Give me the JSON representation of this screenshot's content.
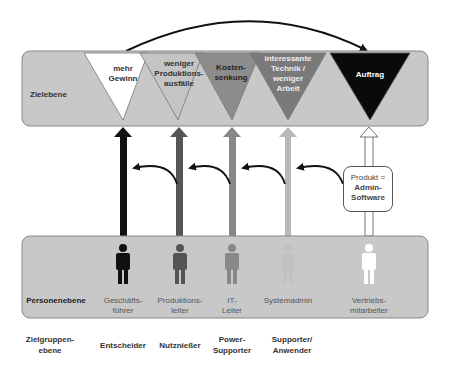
{
  "diagram": {
    "top_panel": {
      "label": "Zielebene"
    },
    "goals": [
      {
        "line1": "mehr",
        "line2": "Gewinn",
        "line3": "",
        "line4": "",
        "fill": "#ffffff",
        "text_color": "#333333"
      },
      {
        "line1": "weniger",
        "line2": "Produktions-",
        "line3": "ausfälle",
        "line4": "",
        "fill": "#c4c4c4",
        "text_color": "#333333"
      },
      {
        "line1": "Kosten-",
        "line2": "senkung",
        "line3": "",
        "line4": "",
        "fill": "#8c8c8c",
        "text_color": "#222222"
      },
      {
        "line1": "interessante",
        "line2": "Technik /",
        "line3": "weniger",
        "line4": "Arbeit",
        "fill": "#7a7a7a",
        "text_color": "#eeeeee"
      },
      {
        "line1": "Auftrag",
        "line2": "",
        "line3": "",
        "line4": "",
        "fill": "#0a0a0a",
        "text_color": "#ffffff"
      }
    ],
    "product_box": {
      "line1": "Produkt =",
      "line2": "Admin-",
      "line3": "Software"
    },
    "bottom_panel": {
      "label": "Personenebene"
    },
    "persons": [
      {
        "line1": "Geschäfts-",
        "line2": "führer",
        "color": "#111111"
      },
      {
        "line1": "Produktions-",
        "line2": "leiter",
        "color": "#555555"
      },
      {
        "line1": "IT-",
        "line2": "Leiter",
        "color": "#888888"
      },
      {
        "line1": "Systemadmin",
        "line2": "",
        "color": "#b8b8b8"
      },
      {
        "line1": "Vertriebs-",
        "line2": "mitarbeiter",
        "color": "#ffffff"
      }
    ],
    "groups": {
      "row_label_1": "Zielgruppen-",
      "row_label_2": "ebene",
      "items": [
        {
          "line1": "Entscheider",
          "line2": ""
        },
        {
          "line1": "Nutznießer",
          "line2": ""
        },
        {
          "line1": "Power-",
          "line2": "Supporter"
        },
        {
          "line1": "Supporter/",
          "line2": "Anwender"
        }
      ]
    },
    "colors": {
      "panel_fill": "#c8c8c8",
      "panel_stroke": "#777777",
      "arrow_black": "#111111",
      "arrow_dark": "#555555",
      "arrow_mid": "#888888",
      "arrow_light": "#b8b8b8"
    }
  }
}
